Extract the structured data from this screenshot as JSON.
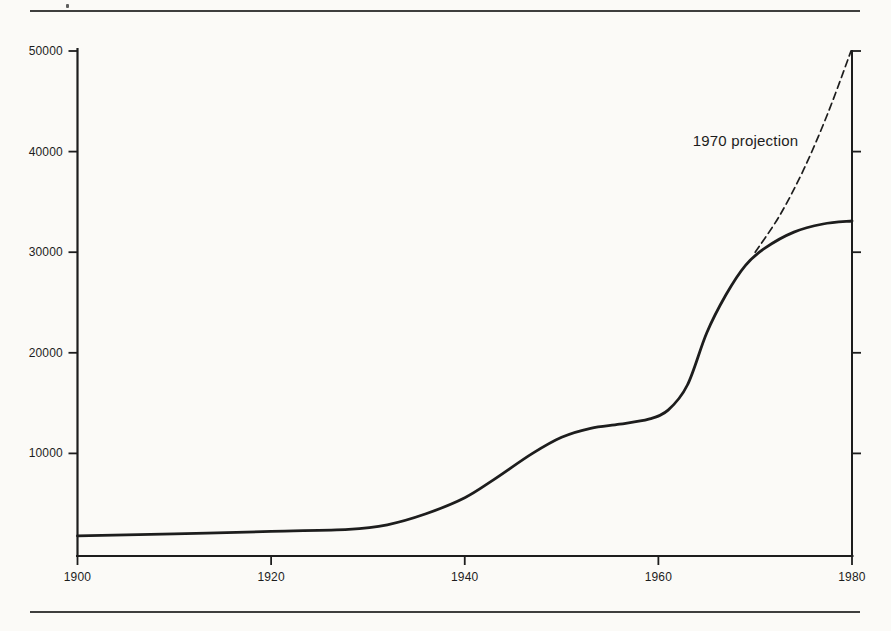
{
  "page": {
    "paper_color": "#fbfaf7",
    "ink_color": "#1d1d1d"
  },
  "annotation": {
    "projection_label": "1970 projection"
  },
  "chart_data": {
    "type": "line",
    "title": "",
    "xlabel": "",
    "ylabel": "",
    "xlim": [
      1900,
      1980
    ],
    "ylim": [
      0,
      50000
    ],
    "x_ticks": [
      1900,
      1920,
      1940,
      1960,
      1980
    ],
    "y_ticks": [
      10000,
      20000,
      30000,
      40000,
      50000
    ],
    "grid": false,
    "legend": "none",
    "annotations": [
      {
        "text": "1970 projection",
        "x": 1969,
        "y": 41100
      }
    ],
    "series": [
      {
        "name": "actual",
        "style": "solid",
        "points": [
          [
            1900,
            1800
          ],
          [
            1910,
            2000
          ],
          [
            1920,
            2250
          ],
          [
            1928,
            2450
          ],
          [
            1932,
            2900
          ],
          [
            1936,
            4000
          ],
          [
            1940,
            5600
          ],
          [
            1943,
            7400
          ],
          [
            1947,
            10000
          ],
          [
            1950,
            11600
          ],
          [
            1953,
            12500
          ],
          [
            1956,
            12900
          ],
          [
            1959,
            13400
          ],
          [
            1961,
            14300
          ],
          [
            1963,
            16800
          ],
          [
            1965,
            22000
          ],
          [
            1967,
            25800
          ],
          [
            1969,
            28700
          ],
          [
            1971,
            30400
          ],
          [
            1974,
            32000
          ],
          [
            1977,
            32800
          ],
          [
            1980,
            33100
          ]
        ]
      },
      {
        "name": "1970 projection",
        "style": "dashed",
        "points": [
          [
            1970,
            30000
          ],
          [
            1972.5,
            33600
          ],
          [
            1975,
            38200
          ],
          [
            1977.5,
            43800
          ],
          [
            1979.9,
            50000
          ]
        ]
      }
    ]
  }
}
